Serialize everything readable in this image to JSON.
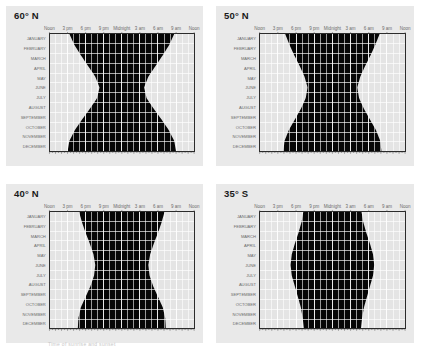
{
  "figure": {
    "background_color": "#ffffff",
    "panel_background_color": "#e9e9e9",
    "caption_below_panel_3": "Time of sunrise and sunset"
  },
  "palette": {
    "daylight": "#e4e4e4",
    "civil_twilight": "#b6b6b6",
    "nautical_twilight": "#7d7d7d",
    "astronomical_twilight": "#3c3c3c",
    "night": "#060606",
    "gridline": "#ffffff",
    "frame": "#2b2b2b",
    "tick": "#555555",
    "axis_label": "#6b6b6b",
    "title": "#1a1a1a"
  },
  "axes": {
    "x_label_text": "Time of day",
    "x_ticks": [
      {
        "label": "Noon",
        "hour": 12
      },
      {
        "label": "3 pm",
        "hour": 15
      },
      {
        "label": "6 pm",
        "hour": 18
      },
      {
        "label": "9 pm",
        "hour": 21
      },
      {
        "label": "Midnight",
        "hour": 24
      },
      {
        "label": "3 am",
        "hour": 27
      },
      {
        "label": "6 am",
        "hour": 30
      },
      {
        "label": "9 am",
        "hour": 33
      },
      {
        "label": "Noon",
        "hour": 36
      }
    ],
    "y_label_text": "Month of year",
    "months": [
      "JANUARY",
      "FEBRUARY",
      "MARCH",
      "APRIL",
      "MAY",
      "JUNE",
      "JULY",
      "AUGUST",
      "SEPTEMBER",
      "OCTOBER",
      "NOVEMBER",
      "DECEMBER"
    ],
    "hour_gridlines": 24,
    "minor_tick_count": 48,
    "x_range_hours": [
      12,
      36
    ],
    "grid": true,
    "legend": "none"
  },
  "chart_data": [
    {
      "type": "area",
      "panel_index": 0,
      "title": "60° N",
      "latitude": 60,
      "hemisphere": "N",
      "xlabel": "",
      "ylabel": "",
      "xlim": [
        12,
        36
      ],
      "ylim": [
        0,
        12
      ],
      "categories": [
        "JANUARY",
        "FEBRUARY",
        "MARCH",
        "APRIL",
        "MAY",
        "JUNE",
        "JULY",
        "AUGUST",
        "SEPTEMBER",
        "OCTOBER",
        "NOVEMBER",
        "DECEMBER"
      ],
      "series": [
        {
          "name": "Sunset (day/night boundary, evening)",
          "values": [
            15.3,
            16.1,
            17.2,
            18.4,
            19.6,
            20.3,
            19.9,
            18.7,
            17.4,
            16.2,
            15.3,
            15.0
          ]
        },
        {
          "name": "Sunrise (day/night boundary, morning)",
          "values": [
            32.7,
            31.9,
            30.8,
            29.6,
            28.4,
            27.7,
            28.1,
            29.3,
            30.6,
            31.8,
            32.7,
            33.0
          ]
        },
        {
          "name": "Civil twilight end (evening)",
          "values": [
            16.2,
            16.9,
            17.9,
            19.1,
            20.6,
            22.0,
            21.0,
            19.5,
            18.1,
            17.0,
            16.2,
            15.9
          ]
        },
        {
          "name": "Civil twilight start (morning)",
          "values": [
            31.8,
            31.1,
            30.1,
            28.9,
            27.4,
            26.0,
            27.0,
            28.5,
            29.9,
            31.0,
            31.8,
            32.1
          ]
        },
        {
          "name": "Nautical twilight end (evening)",
          "values": [
            17.0,
            17.7,
            18.7,
            20.0,
            21.8,
            24.0,
            22.3,
            20.4,
            18.9,
            17.8,
            17.0,
            16.7
          ]
        },
        {
          "name": "Nautical twilight start (morning)",
          "values": [
            31.0,
            30.3,
            29.3,
            28.0,
            26.2,
            24.0,
            25.7,
            27.6,
            29.1,
            30.2,
            31.0,
            31.3
          ]
        },
        {
          "name": "Astronomical twilight end (evening)",
          "values": [
            17.8,
            18.6,
            19.7,
            21.3,
            23.4,
            24.0,
            23.8,
            21.6,
            19.8,
            18.6,
            17.8,
            17.5
          ]
        },
        {
          "name": "Astronomical twilight start (morning)",
          "values": [
            30.2,
            29.4,
            28.3,
            26.7,
            24.6,
            24.0,
            24.2,
            26.4,
            28.2,
            29.4,
            30.2,
            30.5
          ]
        }
      ],
      "notes": "Hourglass fully closes at midsummer: continuous twilight in June."
    },
    {
      "type": "area",
      "panel_index": 1,
      "title": "50° N",
      "latitude": 50,
      "hemisphere": "N",
      "xlabel": "",
      "ylabel": "",
      "xlim": [
        12,
        36
      ],
      "ylim": [
        0,
        12
      ],
      "categories": [
        "JANUARY",
        "FEBRUARY",
        "MARCH",
        "APRIL",
        "MAY",
        "JUNE",
        "JULY",
        "AUGUST",
        "SEPTEMBER",
        "OCTOBER",
        "NOVEMBER",
        "DECEMBER"
      ],
      "series": [
        {
          "name": "Sunset (day/night boundary, evening)",
          "values": [
            16.2,
            16.9,
            17.7,
            18.6,
            19.4,
            19.9,
            19.6,
            18.8,
            17.8,
            16.8,
            16.1,
            15.9
          ]
        },
        {
          "name": "Sunrise (day/night boundary, morning)",
          "values": [
            31.8,
            31.1,
            30.3,
            29.4,
            28.6,
            28.1,
            28.4,
            29.2,
            30.2,
            31.2,
            31.9,
            32.1
          ]
        },
        {
          "name": "Civil twilight end (evening)",
          "values": [
            16.9,
            17.6,
            18.4,
            19.3,
            20.2,
            20.8,
            20.4,
            19.5,
            18.5,
            17.5,
            16.8,
            16.6
          ]
        },
        {
          "name": "Civil twilight start (morning)",
          "values": [
            31.1,
            30.4,
            29.6,
            28.7,
            27.8,
            27.2,
            27.6,
            28.5,
            29.5,
            30.5,
            31.2,
            31.4
          ]
        },
        {
          "name": "Nautical twilight end (evening)",
          "values": [
            17.7,
            18.4,
            19.2,
            20.2,
            21.3,
            22.1,
            21.6,
            20.5,
            19.3,
            18.3,
            17.6,
            17.4
          ]
        },
        {
          "name": "Nautical twilight start (morning)",
          "values": [
            30.3,
            29.6,
            28.8,
            27.8,
            26.7,
            25.9,
            26.4,
            27.5,
            28.7,
            29.7,
            30.4,
            30.6
          ]
        },
        {
          "name": "Astronomical twilight end (evening)",
          "values": [
            18.4,
            19.2,
            20.1,
            21.3,
            22.7,
            23.5,
            23.0,
            21.6,
            20.2,
            19.1,
            18.4,
            18.1
          ]
        },
        {
          "name": "Astronomical twilight start (morning)",
          "values": [
            29.6,
            28.8,
            27.9,
            26.7,
            25.3,
            24.5,
            25.0,
            26.4,
            27.8,
            28.9,
            29.6,
            29.9
          ]
        }
      ],
      "notes": "Hourglass pinches to a narrow waist but night does not vanish entirely."
    },
    {
      "type": "area",
      "panel_index": 2,
      "title": "40° N",
      "latitude": 40,
      "hemisphere": "N",
      "xlabel": "",
      "ylabel": "",
      "xlim": [
        12,
        36
      ],
      "ylim": [
        0,
        12
      ],
      "categories": [
        "JANUARY",
        "FEBRUARY",
        "MARCH",
        "APRIL",
        "MAY",
        "JUNE",
        "JULY",
        "AUGUST",
        "SEPTEMBER",
        "OCTOBER",
        "NOVEMBER",
        "DECEMBER"
      ],
      "series": [
        {
          "name": "Sunset (day/night boundary, evening)",
          "values": [
            16.9,
            17.4,
            18.0,
            18.7,
            19.3,
            19.6,
            19.4,
            18.8,
            18.0,
            17.2,
            16.8,
            16.7
          ]
        },
        {
          "name": "Sunrise (day/night boundary, morning)",
          "values": [
            31.1,
            30.6,
            30.0,
            29.3,
            28.7,
            28.4,
            28.6,
            29.2,
            30.0,
            30.8,
            31.2,
            31.3
          ]
        },
        {
          "name": "Civil twilight end (evening)",
          "values": [
            17.4,
            17.9,
            18.5,
            19.3,
            20.0,
            20.3,
            20.1,
            19.4,
            18.6,
            17.8,
            17.4,
            17.3
          ]
        },
        {
          "name": "Civil twilight start (morning)",
          "values": [
            30.6,
            30.1,
            29.5,
            28.7,
            28.0,
            27.7,
            27.9,
            28.6,
            29.4,
            30.2,
            30.6,
            30.7
          ]
        },
        {
          "name": "Nautical twilight end (evening)",
          "values": [
            18.1,
            18.6,
            19.3,
            20.1,
            20.9,
            21.3,
            21.1,
            20.3,
            19.4,
            18.5,
            18.1,
            18.0
          ]
        },
        {
          "name": "Nautical twilight start (morning)",
          "values": [
            29.9,
            29.4,
            28.7,
            27.9,
            27.1,
            26.7,
            26.9,
            27.7,
            28.6,
            29.5,
            29.9,
            30.0
          ]
        },
        {
          "name": "Astronomical twilight end (evening)",
          "values": [
            18.8,
            19.4,
            20.1,
            21.0,
            21.9,
            22.4,
            22.1,
            21.2,
            20.2,
            19.3,
            18.8,
            18.6
          ]
        },
        {
          "name": "Astronomical twilight start (morning)",
          "values": [
            29.2,
            28.6,
            27.9,
            27.0,
            26.1,
            25.6,
            25.9,
            26.8,
            27.8,
            28.7,
            29.2,
            29.4
          ]
        }
      ],
      "notes": "Waist is wider: a full dark night persists all year."
    },
    {
      "type": "area",
      "panel_index": 3,
      "title": "35° S",
      "latitude": -35,
      "hemisphere": "S",
      "xlabel": "",
      "ylabel": "",
      "xlim": [
        12,
        36
      ],
      "ylim": [
        0,
        12
      ],
      "categories": [
        "JANUARY",
        "FEBRUARY",
        "MARCH",
        "APRIL",
        "MAY",
        "JUNE",
        "JULY",
        "AUGUST",
        "SEPTEMBER",
        "OCTOBER",
        "NOVEMBER",
        "DECEMBER"
      ],
      "series": [
        {
          "name": "Sunset (day/night boundary, evening)",
          "values": [
            19.2,
            18.9,
            18.4,
            17.8,
            17.3,
            17.1,
            17.3,
            17.8,
            18.3,
            18.8,
            19.1,
            19.3
          ]
        },
        {
          "name": "Sunrise (day/night boundary, morning)",
          "values": [
            28.8,
            29.1,
            29.6,
            30.2,
            30.7,
            30.9,
            30.7,
            30.2,
            29.7,
            29.2,
            28.9,
            28.7
          ]
        },
        {
          "name": "Civil twilight end (evening)",
          "values": [
            19.7,
            19.4,
            18.9,
            18.3,
            17.8,
            17.6,
            17.8,
            18.3,
            18.8,
            19.3,
            19.6,
            19.8
          ]
        },
        {
          "name": "Civil twilight start (morning)",
          "values": [
            28.3,
            28.6,
            29.1,
            29.7,
            30.2,
            30.4,
            30.2,
            29.7,
            29.2,
            28.7,
            28.4,
            28.2
          ]
        },
        {
          "name": "Nautical twilight end (evening)",
          "values": [
            20.4,
            20.1,
            19.6,
            18.9,
            18.4,
            18.2,
            18.4,
            18.9,
            19.4,
            20.0,
            20.3,
            20.5
          ]
        },
        {
          "name": "Nautical twilight start (morning)",
          "values": [
            27.6,
            27.9,
            28.4,
            29.1,
            29.6,
            29.8,
            29.6,
            29.1,
            28.6,
            28.0,
            27.7,
            27.5
          ]
        },
        {
          "name": "Astronomical twilight end (evening)",
          "values": [
            21.1,
            20.8,
            20.2,
            19.5,
            19.0,
            18.8,
            19.0,
            19.5,
            20.1,
            20.7,
            21.0,
            21.2
          ]
        },
        {
          "name": "Astronomical twilight start (morning)",
          "values": [
            26.9,
            27.2,
            27.8,
            28.5,
            29.0,
            29.2,
            29.0,
            28.5,
            27.9,
            27.3,
            27.0,
            26.8
          ]
        }
      ],
      "notes": "Southern hemisphere: night is widest in June and July."
    }
  ]
}
